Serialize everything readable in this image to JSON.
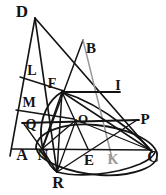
{
  "figure": {
    "type": "geometric-line-diagram",
    "width": 166,
    "height": 195,
    "background_color": "#ffffff",
    "ink_color": "#141414",
    "accent_color": "#9a9a9a"
  },
  "points": [
    {
      "id": "D",
      "label": "D",
      "x": 35,
      "y": 18,
      "label_x": 22,
      "label_y": 11,
      "size": 17
    },
    {
      "id": "B",
      "label": "B",
      "x": 83,
      "y": 40,
      "label_x": 91,
      "label_y": 48,
      "size": 15
    },
    {
      "id": "L",
      "label": "L",
      "x": 21,
      "y": 76,
      "label_x": 32,
      "label_y": 71,
      "size": 14
    },
    {
      "id": "F",
      "label": "F",
      "x": 62,
      "y": 92,
      "label_x": 52,
      "label_y": 84,
      "size": 14
    },
    {
      "id": "I",
      "label": "I",
      "x": 113,
      "y": 92,
      "label_x": 118,
      "label_y": 86,
      "size": 14
    },
    {
      "id": "M",
      "label": "M",
      "x": 17,
      "y": 108,
      "label_x": 29,
      "label_y": 103,
      "size": 14
    },
    {
      "id": "Q",
      "label": "Q",
      "x": 22,
      "y": 123,
      "label_x": 31,
      "label_y": 125,
      "size": 14
    },
    {
      "id": "O",
      "label": "O",
      "x": 76,
      "y": 120,
      "label_x": 83,
      "label_y": 118,
      "size": 13
    },
    {
      "id": "P",
      "label": "P",
      "x": 137,
      "y": 120,
      "label_x": 145,
      "label_y": 119,
      "size": 15
    },
    {
      "id": "A",
      "label": "A",
      "x": 13,
      "y": 149,
      "label_x": 22,
      "label_y": 155,
      "size": 16
    },
    {
      "id": "N",
      "label": "N",
      "x": 42,
      "y": 149,
      "label_x": 43,
      "label_y": 155,
      "size": 15
    },
    {
      "id": "E",
      "label": "E",
      "x": 88,
      "y": 149,
      "label_x": 89,
      "label_y": 160,
      "size": 15
    },
    {
      "id": "K",
      "label": "K",
      "x": 112,
      "y": 149,
      "label_x": 113,
      "label_y": 160,
      "size": 14
    },
    {
      "id": "C",
      "label": "C",
      "x": 150,
      "y": 150,
      "label_x": 153,
      "label_y": 157,
      "size": 16
    },
    {
      "id": "R",
      "label": "R",
      "x": 57,
      "y": 172,
      "label_x": 58,
      "label_y": 183,
      "size": 16
    }
  ],
  "segments": [
    {
      "name": "D-A-left-side",
      "from": "D",
      "to": "A-extended",
      "x1": 35,
      "y1": 18,
      "x2": 10,
      "y2": 156,
      "width": 1.6,
      "color": "#141414"
    },
    {
      "name": "D-to-C",
      "from": "D",
      "to": "C",
      "x1": 35,
      "y1": 18,
      "x2": 152,
      "y2": 152,
      "width": 1.7,
      "color": "#141414"
    },
    {
      "name": "D-to-R",
      "from": "D",
      "to": "R",
      "x1": 35,
      "y1": 18,
      "x2": 57,
      "y2": 172,
      "width": 1.7,
      "color": "#141414"
    },
    {
      "name": "B-to-N",
      "from": "B",
      "to": "N",
      "x1": 83,
      "y1": 40,
      "x2": 42,
      "y2": 150,
      "width": 1.5,
      "color": "#141414"
    },
    {
      "name": "B-to-K-ray",
      "from": "B",
      "to": "K",
      "x1": 83,
      "y1": 40,
      "x2": 112,
      "y2": 158,
      "width": 1.5,
      "color": "#9a9a9a"
    },
    {
      "name": "L-to-F",
      "from": "L",
      "to": "F",
      "x1": 20,
      "y1": 77,
      "x2": 64,
      "y2": 91,
      "width": 1.4,
      "color": "#141414"
    },
    {
      "name": "F-to-I",
      "from": "F",
      "to": "I",
      "x1": 62,
      "y1": 92,
      "x2": 120,
      "y2": 92,
      "width": 1.8,
      "color": "#141414"
    },
    {
      "name": "M-to-O",
      "from": "M",
      "to": "O",
      "x1": 16,
      "y1": 110,
      "x2": 74,
      "y2": 119,
      "width": 1.4,
      "color": "#141414"
    },
    {
      "name": "Q-to-P",
      "from": "Q",
      "to": "P",
      "x1": 22,
      "y1": 123,
      "x2": 139,
      "y2": 120,
      "width": 1.8,
      "color": "#141414"
    },
    {
      "name": "A-to-C",
      "from": "A",
      "to": "C",
      "x1": 12,
      "y1": 149,
      "x2": 152,
      "y2": 150,
      "width": 1.7,
      "color": "#141414"
    },
    {
      "name": "F-to-R",
      "from": "F",
      "to": "R",
      "x1": 62,
      "y1": 92,
      "x2": 57,
      "y2": 172,
      "width": 1.5,
      "color": "#141414"
    },
    {
      "name": "F-to-C",
      "from": "F",
      "to": "C",
      "x1": 62,
      "y1": 92,
      "x2": 150,
      "y2": 150,
      "width": 1.5,
      "color": "#141414"
    },
    {
      "name": "F-to-N",
      "from": "F",
      "to": "N",
      "x1": 62,
      "y1": 92,
      "x2": 42,
      "y2": 149,
      "width": 1.5,
      "color": "#141414"
    },
    {
      "name": "F-to-E",
      "from": "F",
      "to": "E",
      "x1": 62,
      "y1": 92,
      "x2": 88,
      "y2": 149,
      "width": 1.4,
      "color": "#141414"
    },
    {
      "name": "N-to-O",
      "from": "N",
      "to": "O",
      "x1": 42,
      "y1": 149,
      "x2": 76,
      "y2": 120,
      "width": 1.4,
      "color": "#141414"
    },
    {
      "name": "N-to-R",
      "from": "N",
      "to": "R",
      "x1": 42,
      "y1": 149,
      "x2": 57,
      "y2": 172,
      "width": 1.4,
      "color": "#141414"
    },
    {
      "name": "R-to-O",
      "from": "R",
      "to": "O",
      "x1": 57,
      "y1": 172,
      "x2": 76,
      "y2": 120,
      "width": 1.3,
      "color": "#141414"
    },
    {
      "name": "R-to-P",
      "from": "R",
      "to": "P",
      "x1": 57,
      "y1": 172,
      "x2": 137,
      "y2": 120,
      "width": 1.4,
      "color": "#141414"
    },
    {
      "name": "O-to-C",
      "from": "O",
      "to": "C",
      "x1": 76,
      "y1": 120,
      "x2": 150,
      "y2": 150,
      "width": 1.3,
      "color": "#141414"
    },
    {
      "name": "Q-to-N",
      "from": "Q",
      "to": "N",
      "x1": 24,
      "y1": 124,
      "x2": 42,
      "y2": 149,
      "width": 1.3,
      "color": "#141414"
    }
  ],
  "curves": [
    {
      "name": "base-ellipse",
      "description": "tilted ellipse through N, C, R",
      "path": "M 36 148 C 36 132 64 122 96 125 C 128 128 155 141 157 154 C 159 167 132 177 100 175 C 68 173 40 161 37 150 Z",
      "width": 1.8,
      "color": "#141414"
    },
    {
      "name": "cone-section-curve-left",
      "description": "arc from F curving down through N to R",
      "path": "M 62 92 C 48 100 40 118 41 136 C 42 152 48 165 57 172",
      "width": 1.8,
      "color": "#141414"
    },
    {
      "name": "cone-section-curve-right",
      "description": "arc from F sweeping right down to C",
      "path": "M 62 92 C 82 98 104 110 124 126 C 138 137 148 146 152 152",
      "width": 1.8,
      "color": "#141414"
    },
    {
      "name": "ellipse-lower-rim",
      "description": "lower rim of base ellipse from R to C",
      "path": "M 57 172 C 80 178 116 174 140 164 C 149 160 154 156 155 152",
      "width": 1.6,
      "color": "#141414"
    }
  ]
}
